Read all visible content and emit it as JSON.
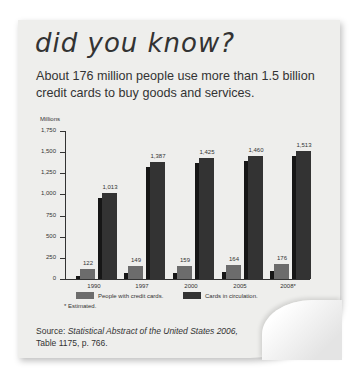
{
  "header": {
    "title": "did you know?",
    "subtitle": "About 176 million people use more than 1.5 billion credit cards to buy goods and services."
  },
  "chart_data": {
    "type": "bar",
    "title": "",
    "xlabel": "",
    "ylabel": "Millions",
    "ylim": [
      0,
      1750
    ],
    "yticks": [
      "0",
      "250",
      "500",
      "750",
      "1,000",
      "1,250",
      "1,500",
      "1,750"
    ],
    "categories": [
      "1990",
      "1997",
      "2000",
      "2005",
      "2008*"
    ],
    "series": [
      {
        "name": "People with credit cards.",
        "color": "#6c6c6c",
        "values": [
          122,
          149,
          159,
          164,
          176
        ],
        "labels": [
          "122",
          "149",
          "159",
          "164",
          "176"
        ]
      },
      {
        "name": "Cards in circulation.",
        "color": "#333333",
        "values": [
          1013,
          1387,
          1425,
          1460,
          1513
        ],
        "labels": [
          "1,013",
          "1,387",
          "1,425",
          "1,460",
          "1,513"
        ]
      }
    ],
    "grid": false,
    "legend_position": "bottom",
    "footnote": "* Estimated."
  },
  "source": {
    "prefix": "Source: ",
    "title": "Statistical Abstract of the United States 2006,",
    "rest": "Table 1175, p. 766."
  }
}
